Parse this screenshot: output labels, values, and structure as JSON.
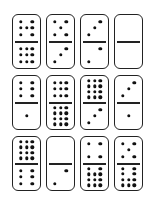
{
  "dominoes": [
    {
      "top": 7,
      "bottom": 9
    },
    {
      "top": 5,
      "bottom": 3
    },
    {
      "top": 3,
      "bottom": 2
    },
    {
      "top": 0,
      "bottom": 0
    },
    {
      "top": 6,
      "bottom": 1
    },
    {
      "top": 9,
      "bottom": 12
    },
    {
      "top": 12,
      "bottom": 3
    },
    {
      "top": 3,
      "bottom": 1
    },
    {
      "top": 12,
      "bottom": 6
    },
    {
      "top": 0,
      "bottom": 2
    },
    {
      "top": 4,
      "bottom": 11
    },
    {
      "top": 5,
      "bottom": 10
    }
  ],
  "colors": {
    "pip": "#111111",
    "border": "#222222",
    "background": "#ffffff"
  }
}
